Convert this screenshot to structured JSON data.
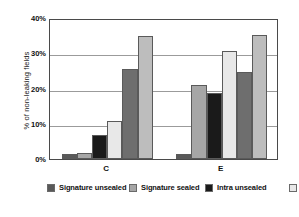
{
  "chart_data": {
    "type": "bar",
    "title": "",
    "xlabel": "",
    "ylabel": "% of non-leaking fields",
    "categories": [
      "C",
      "E"
    ],
    "ylim": [
      0,
      40
    ],
    "yticks": [
      "0%",
      "10%",
      "20%",
      "30%",
      "40%"
    ],
    "ytick_values": [
      0,
      10,
      20,
      30,
      40
    ],
    "grid": true,
    "legend_position": "bottom",
    "series": [
      {
        "name": "Signature unsealed",
        "color": "#595959",
        "values": [
          1.5,
          1.5
        ]
      },
      {
        "name": "Signature sealed",
        "color": "#a6a6a6",
        "values": [
          1.8,
          21.0
        ]
      },
      {
        "name": "Intra unsealed",
        "color": "#1a1a1a",
        "values": [
          6.8,
          18.6
        ]
      },
      {
        "name": "Intra sealed",
        "color": "#e8e8e8",
        "values": [
          10.7,
          30.6
        ]
      },
      {
        "name": "Inter unsealed",
        "color": "#6e6e6e",
        "values": [
          25.5,
          24.8
        ]
      },
      {
        "name": "Inter sealed",
        "color": "#bdbdbd",
        "values": [
          34.8,
          35.3
        ]
      }
    ]
  }
}
